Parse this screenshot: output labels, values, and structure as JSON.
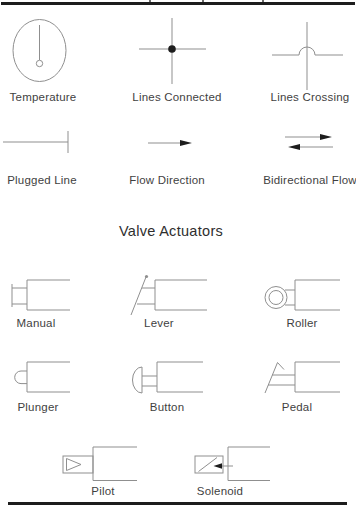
{
  "colors": {
    "line": "#8f8f8f",
    "ink": "#1d1d1d",
    "text": "#3f3f3f",
    "rule": "#1d1d1d",
    "background": "#ffffff"
  },
  "line_symbols": {
    "row1": [
      {
        "icon": "temperature-symbol",
        "label": "Temperature"
      },
      {
        "icon": "lines-connected-symbol",
        "label": "Lines Connected"
      },
      {
        "icon": "lines-crossing-symbol",
        "label": "Lines Crossing"
      }
    ],
    "row2": [
      {
        "icon": "plugged-line-symbol",
        "label": "Plugged Line"
      },
      {
        "icon": "flow-direction-symbol",
        "label": "Flow Direction"
      },
      {
        "icon": "bidirectional-flow-symbol",
        "label": "Bidirectional Flow"
      }
    ]
  },
  "valve_actuators": {
    "heading": "Valve Actuators",
    "row1": [
      {
        "icon": "manual-actuator-symbol",
        "label": "Manual"
      },
      {
        "icon": "lever-actuator-symbol",
        "label": "Lever"
      },
      {
        "icon": "roller-actuator-symbol",
        "label": "Roller"
      }
    ],
    "row2": [
      {
        "icon": "plunger-actuator-symbol",
        "label": "Plunger"
      },
      {
        "icon": "button-actuator-symbol",
        "label": "Button"
      },
      {
        "icon": "pedal-actuator-symbol",
        "label": "Pedal"
      }
    ],
    "row3": [
      {
        "icon": "pilot-actuator-symbol",
        "label": "Pilot"
      },
      {
        "icon": "solenoid-actuator-symbol",
        "label": "Solenoid"
      }
    ]
  }
}
